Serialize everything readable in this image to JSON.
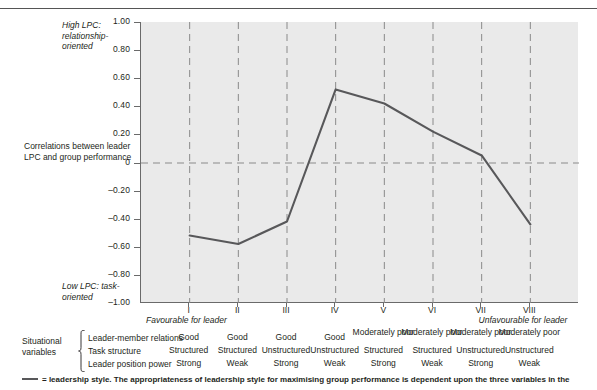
{
  "chart_data": {
    "type": "line",
    "title": "",
    "xlabel": "",
    "ylabel": "Correlations between leader LPC and group performance",
    "ylim": [
      -1.0,
      1.0
    ],
    "grid": true,
    "legend_position": "below",
    "categories": [
      "I",
      "II",
      "III",
      "IV",
      "V",
      "VI",
      "VII",
      "VIII"
    ],
    "series": [
      {
        "name": "leadership style",
        "values": [
          -0.52,
          -0.58,
          -0.42,
          0.52,
          0.42,
          0.22,
          0.05,
          -0.44
        ],
        "color": "#58585a"
      }
    ],
    "yticks": [
      "1.00",
      "0.80",
      "0.60",
      "0.40",
      "0.20",
      "0",
      "-0.20",
      "-0.40",
      "-0.60",
      "-0.80",
      "-1.00"
    ],
    "ytick_values": [
      1.0,
      0.8,
      0.6,
      0.4,
      0.2,
      0,
      -0.2,
      -0.4,
      -0.6,
      -0.8,
      -1.0
    ],
    "annotations": {
      "y_top": "High LPC: relationship-oriented",
      "y_middle": "Correlations between leader LPC and group performance",
      "y_bottom": "Low LPC: task-oriented",
      "x_left": "Favourable for leader",
      "x_right": "Unfavourable for leader"
    }
  },
  "axis": {
    "top_caption": "High LPC: relationship-oriented",
    "middle_caption": "Correlations between leader LPC and group performance",
    "bottom_caption": "Low LPC: task-oriented",
    "favourable": "Favourable for leader",
    "unfavourable": "Unfavourable for leader"
  },
  "situational": {
    "title": "Situational variables",
    "rows": [
      {
        "label": "Leader-member relations",
        "values": [
          "Good",
          "Good",
          "Good",
          "Good",
          "Moderately poor",
          "Moderately poor",
          "Moderately poor",
          "Moderately poor"
        ]
      },
      {
        "label": "Task structure",
        "values": [
          "Structured",
          "Structured",
          "Unstructured",
          "Unstructured",
          "Structured",
          "Structured",
          "Unstructured",
          "Unstructured"
        ]
      },
      {
        "label": "Leader position power",
        "values": [
          "Strong",
          "Weak",
          "Strong",
          "Weak",
          "Strong",
          "Weak",
          "Strong",
          "Weak"
        ]
      }
    ]
  },
  "footnote": {
    "text": "= leadership style. The appropriateness of leadership style for maximising group performance is dependent upon the three variables in the"
  }
}
